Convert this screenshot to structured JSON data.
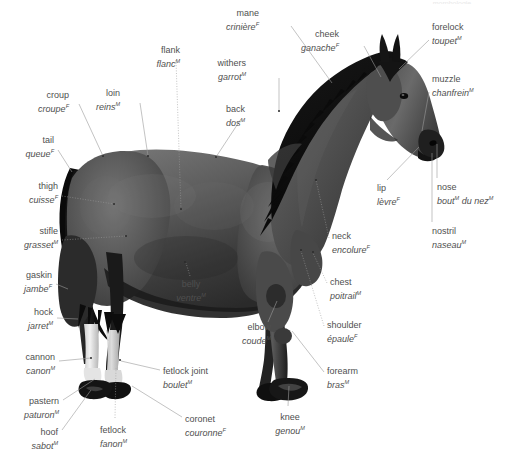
{
  "page": {
    "width": 509,
    "height": 468,
    "background_color": "#ffffff",
    "label_color": "#4f4f4f",
    "leader_line_color": "#9a9a9a",
    "cut_off_header_text": "morphologie"
  },
  "subject": {
    "name": "horse",
    "view": "left side profile, standing, head raised",
    "coat_color": "dark bay / near-black (grayscale photo)",
    "markings": "white socks on both hind legs, dark hooves"
  },
  "labels": [
    {
      "id": "mane",
      "en": "mane",
      "fr": "crinière",
      "gender": "F",
      "align": "right",
      "x": 259,
      "y": 8,
      "point_x": 332,
      "point_y": 82,
      "style": "solid"
    },
    {
      "id": "cheek",
      "en": "cheek",
      "fr": "ganache",
      "gender": "F",
      "align": "right",
      "x": 339,
      "y": 29,
      "point_x": 381,
      "point_y": 76,
      "style": "solid"
    },
    {
      "id": "forelock",
      "en": "forelock",
      "fr": "toupet",
      "gender": "M",
      "align": "left",
      "x": 432,
      "y": 22,
      "point_x": 399,
      "point_y": 68,
      "style": "solid"
    },
    {
      "id": "withers",
      "en": "withers",
      "fr": "garrot",
      "gender": "M",
      "align": "right",
      "x": 246,
      "y": 58,
      "point_x": 279,
      "point_y": 111,
      "style": "solid"
    },
    {
      "id": "muzzle",
      "en": "muzzle",
      "fr": "chanfrein",
      "gender": "M",
      "align": "left",
      "x": 432,
      "y": 74,
      "point_x": 422,
      "point_y": 131,
      "style": "solid"
    },
    {
      "id": "flank",
      "en": "flank",
      "fr": "flanc",
      "gender": "M",
      "align": "right",
      "x": 152,
      "y": 45,
      "point_x": 181,
      "point_y": 209,
      "style": "dotted"
    },
    {
      "id": "loin",
      "en": "loin",
      "fr": "reins",
      "gender": "M",
      "align": "right",
      "x": 105,
      "y": 88,
      "point_x": 148,
      "point_y": 156,
      "style": "solid"
    },
    {
      "id": "back",
      "en": "back",
      "fr": "dos",
      "gender": "M",
      "align": "right",
      "x": 216,
      "y": 104,
      "point_x": 216,
      "point_y": 157,
      "style": "solid"
    },
    {
      "id": "croup",
      "en": "croup",
      "fr": "croupe",
      "gender": "F",
      "align": "right",
      "x": 41,
      "y": 90,
      "point_x": 103,
      "point_y": 156,
      "style": "solid"
    },
    {
      "id": "tail",
      "en": "tail",
      "fr": "queue",
      "gender": "F",
      "align": "right",
      "x": 21,
      "y": 135,
      "point_x": 71,
      "point_y": 172,
      "style": "solid"
    },
    {
      "id": "thigh",
      "en": "thigh",
      "fr": "cuisse",
      "gender": "F",
      "align": "right",
      "x": 23,
      "y": 181,
      "point_x": 113,
      "point_y": 204,
      "style": "dotted"
    },
    {
      "id": "stifle",
      "en": "stifle",
      "fr": "grasset",
      "gender": "M",
      "align": "right",
      "x": 22,
      "y": 226,
      "point_x": 126,
      "point_y": 236,
      "style": "dotted"
    },
    {
      "id": "gaskin",
      "en": "gaskin",
      "fr": "jambe",
      "gender": "F",
      "align": "right",
      "x": 23,
      "y": 270,
      "point_x": 67,
      "point_y": 288,
      "style": "solid"
    },
    {
      "id": "hock",
      "en": "hock",
      "fr": "jarret",
      "gender": "M",
      "align": "right",
      "x": 28,
      "y": 307,
      "point_x": 77,
      "point_y": 318,
      "style": "solid"
    },
    {
      "id": "cannon",
      "en": "cannon",
      "fr": "canon",
      "gender": "M",
      "align": "right",
      "x": 22,
      "y": 352,
      "point_x": 91,
      "point_y": 358,
      "style": "solid"
    },
    {
      "id": "pastern",
      "en": "pastern",
      "fr": "paturon",
      "gender": "M",
      "align": "right",
      "x": 21,
      "y": 396,
      "point_x": 96,
      "point_y": 378,
      "style": "solid"
    },
    {
      "id": "hoof",
      "en": "hoof",
      "fr": "sabot",
      "gender": "M",
      "align": "right",
      "x": 30,
      "y": 427,
      "point_x": 91,
      "point_y": 389,
      "style": "solid"
    },
    {
      "id": "fetlock",
      "en": "fetlock",
      "fr": "fanon",
      "gender": "M",
      "align": "center",
      "x": 104,
      "y": 425,
      "point_x": 115,
      "point_y": 367,
      "style": "dotted"
    },
    {
      "id": "coronet",
      "en": "coronet",
      "fr": "couronne",
      "gender": "F",
      "align": "left",
      "x": 185,
      "y": 414,
      "point_x": 131,
      "point_y": 385,
      "style": "solid"
    },
    {
      "id": "fetlock-joint",
      "en": "fetlock joint",
      "fr": "boulet",
      "gender": "M",
      "align": "left",
      "x": 163,
      "y": 366,
      "point_x": 120,
      "point_y": 360,
      "style": "solid"
    },
    {
      "id": "belly",
      "en": "belly",
      "fr": "ventre",
      "gender": "M",
      "align": "center",
      "x": 183,
      "y": 279,
      "point_x": 185,
      "point_y": 262,
      "style": "dotted"
    },
    {
      "id": "elbow",
      "en": "elbow",
      "fr": "coude",
      "gender": "M",
      "align": "right",
      "x": 239,
      "y": 322,
      "point_x": 276,
      "point_y": 300,
      "style": "solid"
    },
    {
      "id": "knee",
      "en": "knee",
      "fr": "genou",
      "gender": "M",
      "align": "center",
      "x": 281,
      "y": 412,
      "point_x": 288,
      "point_y": 385,
      "style": "solid"
    },
    {
      "id": "shoulder",
      "en": "shoulder",
      "fr": "épaule",
      "gender": "F",
      "align": "left",
      "x": 327,
      "y": 320,
      "point_x": 300,
      "point_y": 250,
      "style": "dotted"
    },
    {
      "id": "forearm",
      "en": "forearm",
      "fr": "bras",
      "gender": "M",
      "align": "left",
      "x": 327,
      "y": 366,
      "point_x": 292,
      "point_y": 330,
      "style": "solid"
    },
    {
      "id": "chest",
      "en": "chest",
      "fr": "poitrail",
      "gender": "M",
      "align": "left",
      "x": 330,
      "y": 277,
      "point_x": 312,
      "point_y": 252,
      "style": "dotted"
    },
    {
      "id": "neck",
      "en": "neck",
      "fr": "encolure",
      "gender": "F",
      "align": "left",
      "x": 332,
      "y": 231,
      "point_x": 315,
      "point_y": 180,
      "style": "dotted"
    },
    {
      "id": "lip",
      "en": "lip",
      "fr": "lèvre",
      "gender": "F",
      "align": "left",
      "x": 377,
      "y": 183,
      "point_x": 419,
      "point_y": 146,
      "style": "solid"
    },
    {
      "id": "nose",
      "en": "nose",
      "fr": "bout du nez",
      "gender": "M",
      "fr_parts": [
        "bout",
        "du nez"
      ],
      "fr_genders": [
        "M",
        "M"
      ],
      "align": "left",
      "x": 437,
      "y": 182,
      "point_x": 437,
      "point_y": 143,
      "style": "solid"
    },
    {
      "id": "nostril",
      "en": "nostril",
      "fr": "naseau",
      "gender": "M",
      "align": "left",
      "x": 432,
      "y": 226,
      "point_x": 432,
      "point_y": 152,
      "style": "solid"
    }
  ],
  "legend": {
    "gender_markers": {
      "F": "feminine (French noun)",
      "M": "masculine (French noun)"
    }
  }
}
